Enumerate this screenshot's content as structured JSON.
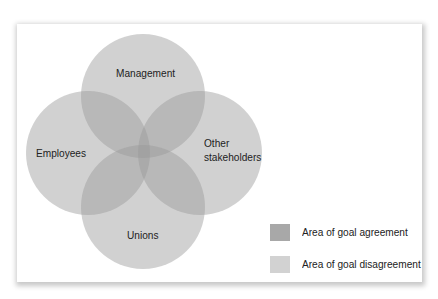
{
  "diagram": {
    "type": "venn",
    "sets": [
      {
        "id": "management",
        "label": "Management"
      },
      {
        "id": "employees",
        "label": "Employees"
      },
      {
        "id": "other-stakeholders",
        "label_line1": "Other",
        "label_line2": "stakeholders"
      },
      {
        "id": "unions",
        "label": "Unions"
      }
    ],
    "center_region": "Area of goal agreement"
  },
  "legend": {
    "items": [
      {
        "label": "Area of goal agreement",
        "color": "#a6a6a6"
      },
      {
        "label": "Area of goal disagreement",
        "color": "#d0d0d0"
      }
    ]
  },
  "colors": {
    "circle_fill": "#c8c8c8",
    "circle_opacity": 0.78
  }
}
